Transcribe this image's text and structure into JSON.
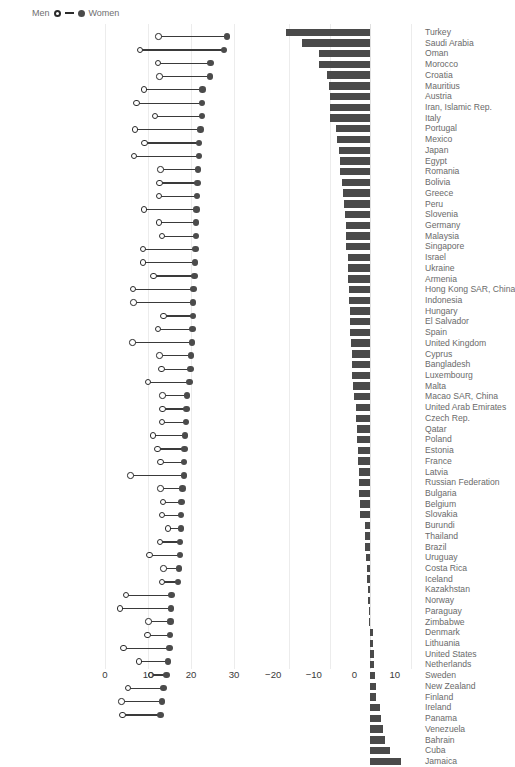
{
  "legend": {
    "left_label": "Men",
    "right_label": "Women",
    "open_marker": "circle-open-icon",
    "filled_marker": "circle-filled-icon"
  },
  "chart_data": [
    {
      "type": "dumbbell",
      "panel": "left",
      "title": "",
      "xlabel": "",
      "ylabel": "",
      "xlim": [
        0,
        33
      ],
      "grid": true,
      "legend_position": "top-left",
      "xticks": [
        0,
        10,
        20,
        30
      ],
      "xticklabels": [
        "0",
        "10",
        "20",
        "30"
      ],
      "series": [
        {
          "name": "Men",
          "marker": "open-circle"
        },
        {
          "name": "Women",
          "marker": "filled-circle"
        }
      ],
      "categories": [
        "Mexico",
        "Guatemala",
        "Argentina",
        "Peru",
        "Ecuador",
        "Algeria",
        "Ethiopia",
        "Albania",
        "Iran",
        "Morocco",
        "Romania",
        "Serbia",
        "Uruguay",
        "Italy",
        "Mongolia",
        "Hungary",
        "Macedonia",
        "Greece",
        "Panama",
        "West Bank & Gaza",
        "Turkey",
        "Moldova, Rep.",
        "Spain",
        "Costa Rica",
        "Bulgaria",
        "Poland",
        "Colombia",
        "New Zealand",
        "Switzerland",
        "Estonia",
        "Kazakhstan",
        "Austria",
        "Kyrgyz Rep.",
        "Tanzania",
        "France",
        "Canada",
        "Réunion",
        "Sweden",
        "Germany",
        "South Africa",
        "Denmark",
        "Finland",
        "Ghana",
        "Japan",
        "Netherlands",
        "United States",
        "Korea, Rep.",
        "Qatar",
        "Norway",
        "Honduras",
        "Brazil",
        "Thailand"
      ],
      "men": [
        12.4,
        8.1,
        12.3,
        12.7,
        9.0,
        7.3,
        11.6,
        7.0,
        9.2,
        6.8,
        12.9,
        12.7,
        12.5,
        9.0,
        12.6,
        13.3,
        8.8,
        8.9,
        11.3,
        6.5,
        6.6,
        13.6,
        12.3,
        6.4,
        12.7,
        13.1,
        10.0,
        13.4,
        13.4,
        13.2,
        11.1,
        12.2,
        12.9,
        5.9,
        12.9,
        13.5,
        13.3,
        14.7,
        12.8,
        10.3,
        13.6,
        13.2,
        4.9,
        3.5,
        10.1,
        9.9,
        4.3,
        7.9,
        10.7,
        5.3,
        3.8,
        4.1
      ],
      "women": [
        28.4,
        27.6,
        24.5,
        24.4,
        22.7,
        22.6,
        22.5,
        22.2,
        21.9,
        21.8,
        21.6,
        21.5,
        21.4,
        21.3,
        21.2,
        21.1,
        21.0,
        20.9,
        20.8,
        20.6,
        20.5,
        20.4,
        20.3,
        20.2,
        20.0,
        19.9,
        19.6,
        19.1,
        18.9,
        18.8,
        18.6,
        18.5,
        18.4,
        18.3,
        18.0,
        17.8,
        17.7,
        17.6,
        17.5,
        17.4,
        17.2,
        17.0,
        15.5,
        15.4,
        15.2,
        15.1,
        15.0,
        14.6,
        14.3,
        13.6,
        13.3,
        12.9
      ]
    },
    {
      "type": "bar",
      "panel": "right",
      "orientation": "horizontal",
      "title": "",
      "xlabel": "",
      "ylabel": "",
      "xlim": [
        -24,
        12
      ],
      "grid": true,
      "xticks": [
        -20,
        -10,
        0,
        10
      ],
      "xticklabels": [
        "−20",
        "−10",
        "0",
        "10"
      ],
      "categories": [
        "Turkey",
        "Saudi Arabia",
        "Oman",
        "Morocco",
        "Croatia",
        "Mauritius",
        "Austria",
        "Iran, Islamic Rep.",
        "Italy",
        "Portugal",
        "Mexico",
        "Japan",
        "Egypt",
        "Romania",
        "Bolivia",
        "Greece",
        "Peru",
        "Slovenia",
        "Germany",
        "Malaysia",
        "Singapore",
        "Israel",
        "Ukraine",
        "Armenia",
        "Hong Kong SAR, China",
        "Indonesia",
        "Hungary",
        "El Salvador",
        "Spain",
        "United Kingdom",
        "Cyprus",
        "Bangladesh",
        "Luxembourg",
        "Malta",
        "Macao SAR, China",
        "United Arab Emirates",
        "Czech Rep.",
        "Qatar",
        "Poland",
        "Estonia",
        "France",
        "Latvia",
        "Russian Federation",
        "Bulgaria",
        "Belgium",
        "Slovakia",
        "Burundi",
        "Thailand",
        "Brazil",
        "Uruguay",
        "Costa Rica",
        "Iceland",
        "Kazakhstan",
        "Norway",
        "Paraguay",
        "Zimbabwe",
        "Denmark",
        "Lithuania",
        "United States",
        "Netherlands",
        "Sweden",
        "New Zealand",
        "Finland",
        "Ireland",
        "Panama",
        "Venezuela",
        "Bahrain",
        "Cuba",
        "Jamaica"
      ],
      "values": [
        -20.7,
        -16.8,
        -12.6,
        -12.6,
        -10.6,
        -10.3,
        -10.0,
        -10.0,
        -10.0,
        -8.4,
        -8.2,
        -7.8,
        -7.6,
        -7.4,
        -6.9,
        -6.8,
        -6.4,
        -6.2,
        -6.1,
        -6.0,
        -5.9,
        -5.6,
        -5.5,
        -5.4,
        -5.3,
        -5.2,
        -5.1,
        -5.0,
        -4.9,
        -4.8,
        -4.6,
        -4.5,
        -4.4,
        -4.2,
        -4.0,
        -3.6,
        -3.5,
        -3.3,
        -3.2,
        -3.1,
        -3.0,
        -2.9,
        -2.8,
        -2.7,
        -2.6,
        -2.5,
        -1.4,
        -1.3,
        -1.2,
        -1.1,
        -0.9,
        -0.7,
        -0.6,
        -0.5,
        -0.4,
        -0.3,
        0.6,
        0.7,
        0.9,
        1.0,
        1.1,
        1.3,
        1.4,
        2.3,
        2.6,
        3.2,
        3.6,
        4.8,
        7.6
      ]
    }
  ]
}
